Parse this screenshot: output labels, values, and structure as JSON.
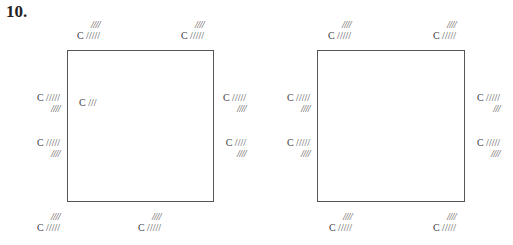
{
  "problem_number": "10.",
  "diagrams": [
    {
      "name": "left",
      "top": [
        {
          "line1": "////",
          "line2": "C /////"
        },
        {
          "line1": "////",
          "line2": "C /////"
        }
      ],
      "left": [
        {
          "line1": "C /////",
          "line2": "////"
        },
        {
          "line1": "C /////",
          "line2": "////"
        }
      ],
      "right": [
        {
          "line1": "C /////",
          "line2": "////"
        },
        {
          "line1": "C ////",
          "line2": "////"
        }
      ],
      "bottom": [
        {
          "line1": "////",
          "line2": "C /////"
        },
        {
          "line1": "////",
          "line2": "C /////"
        }
      ],
      "inner": "C ///"
    },
    {
      "name": "right",
      "top": [
        {
          "line1": "////",
          "line2": "C /////"
        },
        {
          "line1": "////",
          "line2": "C /////"
        }
      ],
      "left": [
        {
          "line1": "C /////",
          "line2": "////"
        },
        {
          "line1": "C /////",
          "line2": "////"
        }
      ],
      "right": [
        {
          "line1": "C /////",
          "line2": "///"
        },
        {
          "line1": "C /////",
          "line2": "////"
        }
      ],
      "bottom": [
        {
          "line1": "////",
          "line2": "C /////"
        },
        {
          "line1": "////",
          "line2": "C /////"
        }
      ]
    }
  ]
}
